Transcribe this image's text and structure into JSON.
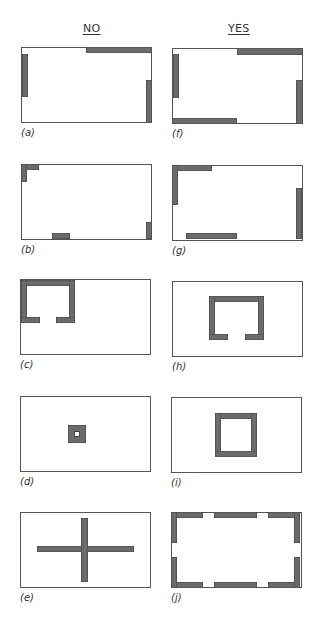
{
  "headers": {
    "left": "NO",
    "right": "YES"
  },
  "colors": {
    "fill": "#6b6b6b",
    "stroke": "#444444",
    "border": "#555555",
    "background": "#ffffff"
  },
  "panels": [
    {
      "id": "a",
      "label": "(a)",
      "column": "NO",
      "x": 21,
      "y": 47,
      "bars": [
        [
          65,
          0,
          66,
          6
        ],
        [
          1,
          7,
          6,
          43
        ],
        [
          125,
          33,
          6,
          43
        ]
      ]
    },
    {
      "id": "b",
      "label": "(b)",
      "column": "NO",
      "x": 21,
      "y": 164,
      "bars": [
        [
          0,
          0,
          18,
          6
        ],
        [
          0,
          0,
          6,
          18
        ],
        [
          31,
          69,
          18,
          6
        ],
        [
          125,
          58,
          6,
          17
        ]
      ]
    },
    {
      "id": "c",
      "label": "(c)",
      "column": "NO",
      "x": 20,
      "y": 279,
      "bars": [
        [
          1,
          1,
          54,
          6
        ],
        [
          1,
          1,
          6,
          43
        ],
        [
          49,
          1,
          6,
          43
        ],
        [
          1,
          38,
          19,
          6
        ],
        [
          36,
          38,
          19,
          6
        ]
      ]
    },
    {
      "id": "d",
      "label": "(d)",
      "column": "NO",
      "x": 20,
      "y": 396,
      "bars": [
        [
          48,
          29,
          18,
          18
        ]
      ],
      "holes": [
        [
          54,
          35,
          6,
          6
        ]
      ]
    },
    {
      "id": "e",
      "label": "(e)",
      "column": "NO",
      "x": 20,
      "y": 512,
      "bars": [
        [
          17,
          34,
          97,
          6
        ],
        [
          61,
          6,
          7,
          64
        ]
      ]
    },
    {
      "id": "f",
      "label": "(f)",
      "column": "YES",
      "x": 172,
      "y": 48,
      "bars": [
        [
          65,
          0,
          66,
          7
        ],
        [
          1,
          6,
          6,
          44
        ],
        [
          124,
          32,
          7,
          44
        ],
        [
          0,
          70,
          65,
          6
        ]
      ]
    },
    {
      "id": "g",
      "label": "(g)",
      "column": "YES",
      "x": 172,
      "y": 165,
      "bars": [
        [
          0,
          0,
          40,
          6
        ],
        [
          0,
          0,
          6,
          40
        ],
        [
          14,
          68,
          51,
          6
        ],
        [
          124,
          23,
          6,
          51
        ]
      ]
    },
    {
      "id": "h",
      "label": "(h)",
      "column": "YES",
      "x": 172,
      "y": 281,
      "bars": [
        [
          37,
          15,
          55,
          6
        ],
        [
          37,
          15,
          6,
          44
        ],
        [
          86,
          15,
          6,
          44
        ],
        [
          37,
          53,
          19,
          6
        ],
        [
          73,
          53,
          19,
          6
        ]
      ]
    },
    {
      "id": "i",
      "label": "(i)",
      "column": "YES",
      "x": 171,
      "y": 397,
      "bars": [
        [
          44,
          16,
          42,
          6
        ],
        [
          44,
          16,
          6,
          44
        ],
        [
          80,
          16,
          6,
          44
        ],
        [
          44,
          54,
          42,
          6
        ]
      ]
    },
    {
      "id": "j",
      "label": "(j)",
      "column": "YES",
      "x": 171,
      "y": 512,
      "bars": [
        [
          0,
          0,
          32,
          6
        ],
        [
          43,
          0,
          43,
          6
        ],
        [
          97,
          0,
          32,
          6
        ],
        [
          0,
          70,
          32,
          6
        ],
        [
          43,
          70,
          43,
          6
        ],
        [
          97,
          70,
          32,
          6
        ],
        [
          0,
          0,
          6,
          31
        ],
        [
          0,
          45,
          6,
          31
        ],
        [
          123,
          0,
          6,
          31
        ],
        [
          123,
          45,
          6,
          31
        ]
      ]
    }
  ]
}
